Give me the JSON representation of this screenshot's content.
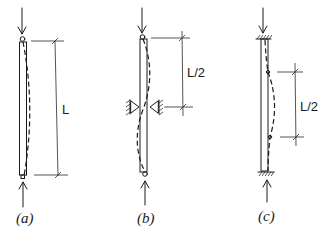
{
  "figure": {
    "panels": [
      {
        "id": "a",
        "caption": "(a)",
        "support": "pinned-pinned",
        "dimension_label": "L",
        "deflected_shape": "single half-sine bow"
      },
      {
        "id": "b",
        "caption": "(b)",
        "support": "pinned-pinned with mid-height lateral brace",
        "dimension_label": "L/2",
        "deflected_shape": "two half-waves with inflection at brace"
      },
      {
        "id": "c",
        "caption": "(c)",
        "support": "fixed-fixed",
        "dimension_label": "L/2",
        "deflected_shape": "curve with inflection points at quarter heights"
      }
    ]
  },
  "colors": {
    "ink": "#1a1a1a",
    "background": "#ffffff"
  }
}
